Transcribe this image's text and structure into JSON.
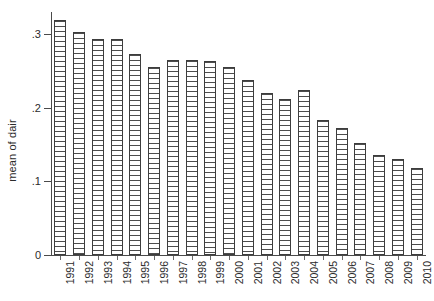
{
  "chart": {
    "ylabel": "mean of dair",
    "xlabel": "",
    "title": ""
  },
  "chart_data": {
    "type": "bar",
    "title": "",
    "xlabel": "",
    "ylabel": "mean of dair",
    "ylim": [
      0,
      0.33
    ],
    "yticks": [
      0,
      0.1,
      0.2,
      0.3
    ],
    "ytick_labels": [
      "0",
      ".1",
      ".2",
      ".3"
    ],
    "grid": false,
    "legend": null,
    "categories": [
      "1991",
      "1992",
      "1993",
      "1994",
      "1995",
      "1996",
      "1997",
      "1998",
      "1999",
      "2000",
      "2001",
      "2002",
      "2003",
      "2004",
      "2005",
      "2006",
      "2007",
      "2008",
      "2009",
      "2010"
    ],
    "values": [
      0.319,
      0.303,
      0.294,
      0.294,
      0.273,
      0.255,
      0.265,
      0.265,
      0.263,
      0.255,
      0.237,
      0.22,
      0.212,
      0.224,
      0.184,
      0.173,
      0.152,
      0.136,
      0.13,
      0.118
    ],
    "bar_style": {
      "fill": "horizontal-line-hatch",
      "edge_color": "#3d3d3d",
      "face_color": "#ffffff"
    }
  }
}
